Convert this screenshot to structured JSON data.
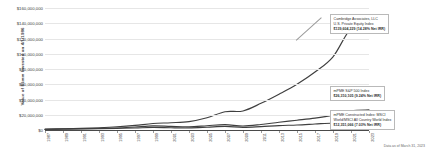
{
  "chart_data": {
    "type": "line",
    "title": "",
    "xlabel": "",
    "ylabel": "Value of $1mm Invested on 4/1/1986",
    "ylim": [
      0,
      160000000
    ],
    "xlim": [
      1986,
      2023
    ],
    "grid": true,
    "legend_position": "annotations-right",
    "ytick_labels": [
      "$160,000,000",
      "$140,000,000",
      "$120,000,000",
      "$100,000,000",
      "$80,000,000",
      "$60,000,000",
      "$40,000,000",
      "$20,000,000",
      "$0"
    ],
    "ytick_values": [
      160000000,
      140000000,
      120000000,
      100000000,
      80000000,
      60000000,
      40000000,
      20000000,
      0
    ],
    "xtick_labels": [
      "1987",
      "1989",
      "1991",
      "1993",
      "1995",
      "1997",
      "1999",
      "2001",
      "2003",
      "2005",
      "2007",
      "2009",
      "2011",
      "2013",
      "2015",
      "2017",
      "2019",
      "2021",
      "2023"
    ],
    "x": [
      1987,
      1989,
      1991,
      1993,
      1995,
      1997,
      1999,
      2001,
      2003,
      2005,
      2007,
      2009,
      2011,
      2013,
      2015,
      2017,
      2019,
      2021,
      2023
    ],
    "series": [
      {
        "name": "Cambridge Associates, LLC U.S. Private Equity Index",
        "color": "#3f3f3f",
        "values": [
          1000000,
          1500000,
          2100000,
          3000000,
          4200000,
          6000000,
          8500000,
          9500000,
          11000000,
          16000000,
          24000000,
          25000000,
          35000000,
          47000000,
          60000000,
          76000000,
          96000000,
          133000000,
          139604229
        ]
      },
      {
        "name": "mPME S&P 500 Index",
        "color": "#3f3f3f",
        "values": [
          1000000,
          1300000,
          1600000,
          2000000,
          2600000,
          3900000,
          5400000,
          4700000,
          4200000,
          5600000,
          7000000,
          5200000,
          7200000,
          10200000,
          12800000,
          15600000,
          19500000,
          25200000,
          26310105
        ]
      },
      {
        "name": "mPME Constructed Index: MSCI World/MSCI All Country World Index",
        "color": "#3f3f3f",
        "values": [
          1000000,
          1250000,
          1450000,
          1750000,
          2150000,
          2600000,
          3400000,
          2900000,
          2700000,
          3600000,
          4700000,
          3500000,
          4500000,
          5800000,
          6600000,
          7900000,
          9200000,
          11800000,
          12351066
        ]
      }
    ],
    "annotations": [
      {
        "id": "private-equity",
        "lines": [
          "Cambridge Associates, LLC",
          "U.S. Private Equity Index"
        ],
        "value": "$139,604,229 (14.28% Net IRR)"
      },
      {
        "id": "sp500",
        "lines": [
          "mPME S&P 500 Index"
        ],
        "value": "$26,310,105 (9.24% Net IRR)"
      },
      {
        "id": "msci-world",
        "lines": [
          "mPME Constructed Index: MSCI",
          "World/MSCI All Country World Index"
        ],
        "value": "$12,351,066 (7.03% Net IRR)"
      }
    ],
    "footnote": "Data as of March 31, 2023"
  }
}
